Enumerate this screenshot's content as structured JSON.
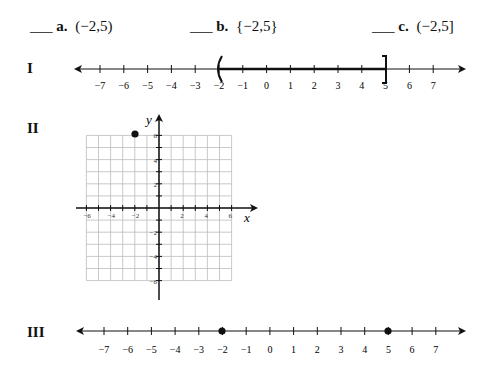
{
  "options": [
    {
      "blank": "___",
      "letter": "a.",
      "expr": "(−2,5)"
    },
    {
      "blank": "___",
      "letter": "b.",
      "expr": "{−2,5}"
    },
    {
      "blank": "___",
      "letter": "c.",
      "expr": "(−2,5]"
    }
  ],
  "figures": {
    "I": {
      "label": "I",
      "ticks": [
        "−7",
        "−6",
        "−5",
        "−4",
        "−3",
        "−2",
        "−1",
        "0",
        "1",
        "2",
        "3",
        "4",
        "5",
        "6",
        "7"
      ],
      "interval": {
        "from": -2,
        "to": 5,
        "left": "(",
        "right": "]"
      }
    },
    "II": {
      "label": "II",
      "x_axis": "x",
      "y_axis": "y",
      "x_ticks": [
        "−6",
        "−4",
        "−2",
        "2",
        "4",
        "6"
      ],
      "y_ticks": [
        "6",
        "4",
        "2",
        "−2",
        "−4",
        "−6"
      ],
      "point": [
        -2,
        5
      ]
    },
    "III": {
      "label": "III",
      "ticks": [
        "−7",
        "−6",
        "−5",
        "−4",
        "−3",
        "−2",
        "−1",
        "0",
        "1",
        "2",
        "3",
        "4",
        "5",
        "6",
        "7"
      ],
      "points": [
        -2,
        5
      ]
    }
  },
  "chart_data": [
    {
      "type": "number-line",
      "title": "I",
      "range": [
        -7,
        7
      ],
      "interval": "(-2,5]"
    },
    {
      "type": "scatter",
      "title": "II",
      "xlabel": "x",
      "ylabel": "y",
      "xlim": [
        -6,
        6
      ],
      "ylim": [
        -6,
        6
      ],
      "grid": true,
      "x": [
        -2
      ],
      "y": [
        5
      ]
    },
    {
      "type": "number-line",
      "title": "III",
      "range": [
        -7,
        7
      ],
      "points": [
        -2,
        5
      ]
    }
  ]
}
